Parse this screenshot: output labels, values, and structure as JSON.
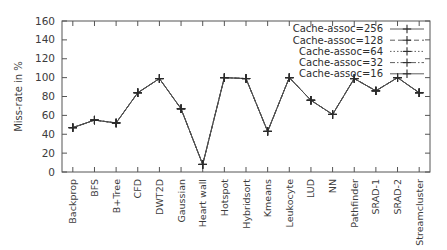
{
  "chart_data": {
    "type": "line",
    "title": "",
    "subtitle": "",
    "xlabel": "",
    "ylabel": "Miss-rate in %",
    "ylim": [
      0,
      160
    ],
    "ytick_step": 20,
    "yticks": [
      "0",
      "20",
      "40",
      "60",
      "80",
      "100",
      "120",
      "140",
      "160"
    ],
    "grid": false,
    "legend_position": "top-right",
    "legend_box": false,
    "categories": [
      "Backprop",
      "BFS",
      "B+Tree",
      "CFD",
      "DWT2D",
      "Gaussian",
      "Heart wall",
      "Hotspot",
      "Hybridsort",
      "Kmeans",
      "Leukocyte",
      "LUD",
      "NN",
      "Pathfinder",
      "SRAD-1",
      "SRAD-2",
      "Streamcluster"
    ],
    "series": [
      {
        "name": "Cache-assoc=256",
        "dash": "solid",
        "values": [
          47,
          55,
          52,
          84,
          99,
          67,
          8,
          100,
          99,
          43,
          100,
          76,
          61,
          99,
          86,
          100,
          84
        ]
      },
      {
        "name": "Cache-assoc=128",
        "dash": "dashed",
        "values": [
          47,
          55,
          52,
          84,
          99,
          67,
          8,
          100,
          99,
          43,
          100,
          76,
          61,
          99,
          86,
          100,
          84
        ]
      },
      {
        "name": "Cache-assoc=64",
        "dash": "dotted",
        "values": [
          47,
          55,
          52,
          84,
          99,
          67,
          8,
          100,
          99,
          43,
          100,
          76,
          61,
          99,
          86,
          100,
          84
        ]
      },
      {
        "name": "Cache-assoc=32",
        "dash": "dash-dot",
        "values": [
          47,
          55,
          52,
          84,
          99,
          67,
          8,
          100,
          99,
          43,
          100,
          76,
          61,
          99,
          86,
          100,
          84
        ]
      },
      {
        "name": "Cache-assoc=16",
        "dash": "solid",
        "values": [
          47,
          55,
          52,
          84,
          99,
          67,
          8,
          100,
          99,
          43,
          100,
          76,
          61,
          99,
          86,
          100,
          84
        ]
      }
    ],
    "marker": "plus",
    "colors": {
      "line": "#4d4d4d",
      "marker": "#2b2b2b",
      "axis": "#555555",
      "text": "#3c3c3c",
      "background": "#ffffff"
    }
  },
  "legend": {
    "entries": [
      {
        "label": "Cache-assoc=256"
      },
      {
        "label": "Cache-assoc=128"
      },
      {
        "label": "Cache-assoc=64"
      },
      {
        "label": "Cache-assoc=32"
      },
      {
        "label": "Cache-assoc=16"
      }
    ]
  }
}
